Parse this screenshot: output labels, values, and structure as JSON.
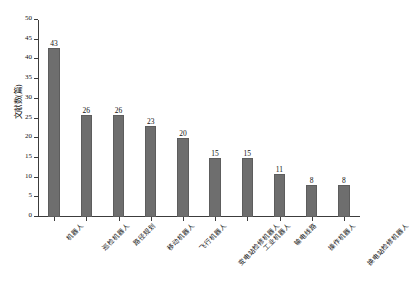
{
  "chart_data": {
    "type": "bar",
    "title": "",
    "xlabel": "",
    "ylabel": "文献数(篇)",
    "ylim": [
      0,
      50
    ],
    "yticks": [
      0,
      5,
      10,
      15,
      20,
      25,
      30,
      35,
      40,
      45,
      50
    ],
    "grid": false,
    "legend": null,
    "bar_color": "#6e6e6e",
    "categories": [
      "机器人",
      "巡检机器人",
      "路径规划",
      "移动机器人",
      "飞行机器人",
      "变电站检修机器人",
      "工业机器人",
      "输电线路",
      "操作机器人",
      "换电站检修机器人"
    ],
    "values": [
      43,
      26,
      26,
      23,
      20,
      15,
      15,
      11,
      8,
      8
    ],
    "value_labels": [
      "43",
      "26",
      "26",
      "23",
      "20",
      "15",
      "15",
      "11",
      "8",
      "8"
    ]
  }
}
